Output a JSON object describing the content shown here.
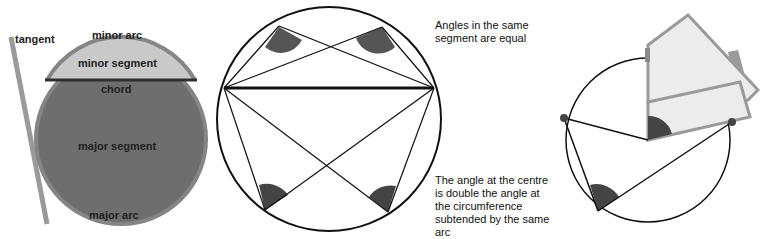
{
  "figure1": {
    "labels": {
      "tangent": "tangent",
      "minor_arc": "minor arc",
      "minor_segment": "minor segment",
      "chord": "chord",
      "major_segment": "major segment",
      "major_arc": "major arc"
    },
    "colors": {
      "major_segment": "#6e6e6e",
      "minor_segment": "#c8c8c8",
      "rim": "#8a8a8a",
      "tangent": "#9a9a9a",
      "chord": "#333333"
    }
  },
  "figure2": {
    "caption": "Angles in the same segment are equal",
    "caption_lines": [
      "Angles in the same",
      "segment are equal"
    ]
  },
  "figure3": {
    "caption": "The angle at the centre is double the angle at the circumference subtended by the same arc",
    "caption_lines": [
      "The angle at the centre",
      "is double the angle at",
      "the circumference",
      "subtended by the same",
      "arc"
    ],
    "colors": {
      "card_fill": "#ececec",
      "card_border": "#9a9a9a",
      "angle_fill": "#444444"
    }
  }
}
